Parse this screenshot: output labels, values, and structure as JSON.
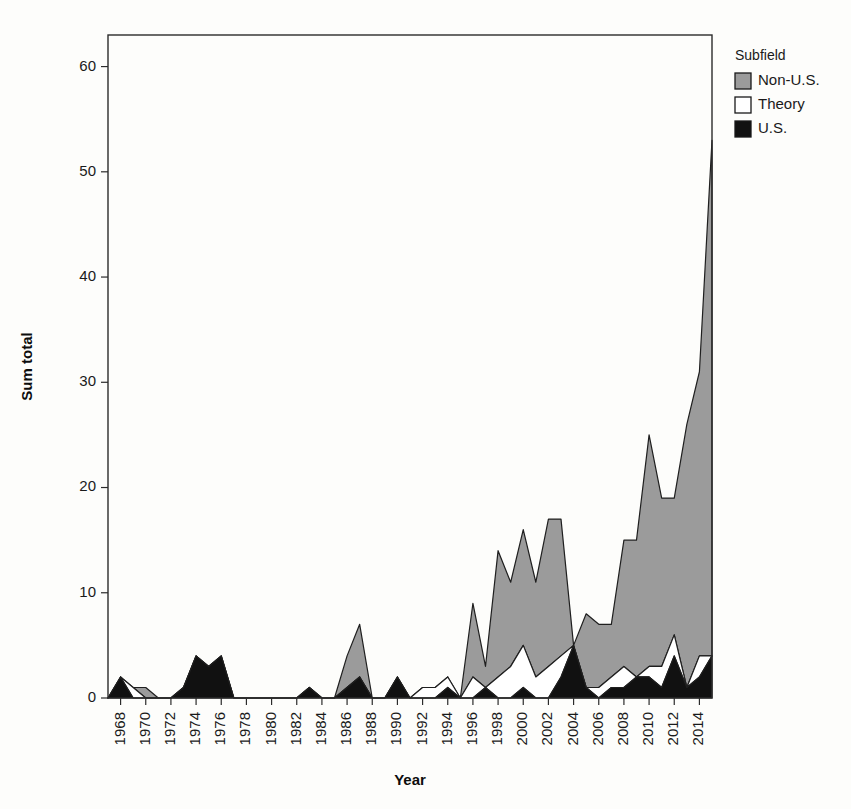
{
  "chart_data": {
    "type": "area",
    "stacked": true,
    "title": "",
    "xlabel": "Year",
    "ylabel": "Sum total",
    "xlim": [
      1967,
      2015
    ],
    "ylim": [
      0,
      63
    ],
    "yticks": [
      0,
      10,
      20,
      30,
      40,
      50,
      60
    ],
    "xticks": [
      1968,
      1970,
      1972,
      1974,
      1976,
      1978,
      1980,
      1982,
      1984,
      1986,
      1988,
      1990,
      1992,
      1994,
      1996,
      1998,
      2000,
      2002,
      2004,
      2006,
      2008,
      2010,
      2012,
      2014
    ],
    "xtick_labels": [
      "1968",
      "1970",
      "1972",
      "1974",
      "1976",
      "1978",
      "1980",
      "1982",
      "1984",
      "1986",
      "1988",
      "1990",
      "1992",
      "1994",
      "1996",
      "1998",
      "2000",
      "2002",
      "2004",
      "2006",
      "2008",
      "2010",
      "2012",
      "2014"
    ],
    "ytick_labels": [
      "0",
      "10",
      "20",
      "30",
      "40",
      "50",
      "60"
    ],
    "grid": false,
    "legend_position": "right",
    "legend_title": "Subfield",
    "x": [
      1967,
      1968,
      1969,
      1970,
      1971,
      1972,
      1973,
      1974,
      1975,
      1976,
      1977,
      1978,
      1979,
      1980,
      1981,
      1982,
      1983,
      1984,
      1985,
      1986,
      1987,
      1988,
      1989,
      1990,
      1991,
      1992,
      1993,
      1994,
      1995,
      1996,
      1997,
      1998,
      1999,
      2000,
      2001,
      2002,
      2003,
      2004,
      2005,
      2006,
      2007,
      2008,
      2009,
      2010,
      2011,
      2012,
      2013,
      2014,
      2015
    ],
    "series": [
      {
        "name": "U.S.",
        "color": "#111111",
        "stack_order": 1,
        "values": [
          0,
          2,
          0,
          0,
          0,
          0,
          1,
          4,
          3,
          4,
          0,
          0,
          0,
          0,
          0,
          0,
          1,
          0,
          0,
          1,
          2,
          0,
          0,
          2,
          0,
          0,
          0,
          1,
          0,
          0,
          1,
          0,
          0,
          1,
          0,
          0,
          2,
          5,
          1,
          0,
          1,
          1,
          2,
          2,
          1,
          4,
          1,
          2,
          4
        ]
      },
      {
        "name": "Theory",
        "color": "#ffffff",
        "stack_order": 2,
        "values": [
          0,
          0,
          1,
          0,
          0,
          0,
          0,
          0,
          0,
          0,
          0,
          0,
          0,
          0,
          0,
          0,
          0,
          0,
          0,
          0,
          0,
          0,
          0,
          0,
          0,
          1,
          1,
          1,
          0,
          2,
          0,
          2,
          3,
          4,
          2,
          3,
          2,
          0,
          0,
          1,
          1,
          2,
          0,
          1,
          2,
          2,
          0,
          2,
          0
        ]
      },
      {
        "name": "Non-U.S.",
        "color": "#9b9b9b",
        "stack_order": 3,
        "values": [
          0,
          0,
          0,
          1,
          0,
          0,
          0,
          0,
          0,
          0,
          0,
          0,
          0,
          0,
          0,
          0,
          0,
          0,
          0,
          3,
          5,
          0,
          0,
          0,
          0,
          0,
          0,
          0,
          0,
          7,
          2,
          12,
          8,
          11,
          9,
          14,
          13,
          0,
          7,
          6,
          5,
          12,
          13,
          22,
          16,
          13,
          25,
          27,
          49
        ]
      }
    ]
  },
  "legend": {
    "title": "Subfield",
    "entries": [
      {
        "label": "Non-U.S.",
        "color": "#9b9b9b"
      },
      {
        "label": "Theory",
        "color": "#ffffff"
      },
      {
        "label": "U.S.",
        "color": "#111111"
      }
    ]
  }
}
